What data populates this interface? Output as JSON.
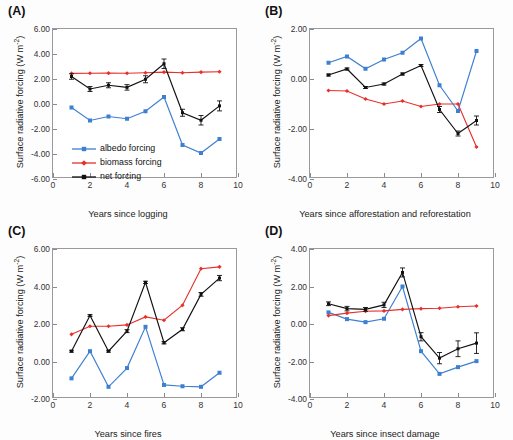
{
  "figure": {
    "ylabel": "Surface radiative forcing (W m",
    "ylabel_sup": "-2",
    "ylabel_end": ")",
    "colors": {
      "albedo": "#3d7fd0",
      "biomass": "#e8302a",
      "net": "#111111",
      "axis": "#9a9a9a",
      "background": "#ffffff"
    },
    "legend": {
      "albedo": "albedo forcing",
      "biomass": "biomass forcing",
      "net": "net forcing"
    }
  },
  "chart_data": [
    {
      "panel": "(A)",
      "type": "line",
      "title": "",
      "xlabel": "Years since logging",
      "ylabel": "Surface radiative forcing (W m-2)",
      "x": [
        1,
        2,
        3,
        4,
        5,
        6,
        7,
        8,
        9
      ],
      "xticks": [
        0,
        2,
        4,
        6,
        8,
        10
      ],
      "xticklabels": [
        "0",
        "2",
        "4",
        "6",
        "8",
        "10"
      ],
      "xlim": [
        0,
        10
      ],
      "yticks": [
        -6,
        -4,
        -2,
        0,
        2,
        4,
        6
      ],
      "yticklabels": [
        "-6.00",
        "-4.00",
        "-2.00",
        "0.00",
        "2.00",
        "4.00",
        "6.00"
      ],
      "ylim": [
        -6,
        6
      ],
      "grid": false,
      "legend_position": "lower-left",
      "series": [
        {
          "name": "albedo forcing",
          "color": "#3d7fd0",
          "marker": "square",
          "values": [
            -0.28,
            -1.32,
            -1.0,
            -1.18,
            -0.58,
            0.56,
            -3.28,
            -3.92,
            -2.8
          ],
          "errors": [
            0,
            0,
            0,
            0,
            0,
            0,
            0,
            0,
            0
          ]
        },
        {
          "name": "biomass forcing",
          "color": "#e8302a",
          "marker": "diamond",
          "values": [
            2.45,
            2.46,
            2.47,
            2.46,
            2.5,
            2.55,
            2.5,
            2.55,
            2.58
          ],
          "errors": [
            0,
            0,
            0,
            0,
            0,
            0,
            0,
            0,
            0
          ]
        },
        {
          "name": "net forcing",
          "color": "#111111",
          "marker": "square",
          "values": [
            2.2,
            1.2,
            1.5,
            1.33,
            1.98,
            3.22,
            -0.7,
            -1.3,
            -0.15
          ],
          "errors": [
            0.22,
            0.2,
            0.2,
            0.22,
            0.28,
            0.38,
            0.28,
            0.38,
            0.4
          ]
        }
      ]
    },
    {
      "panel": "(B)",
      "type": "line",
      "title": "",
      "xlabel": "Years since afforestation and reforestation",
      "ylabel": "Surface radiative forcing (W m-2)",
      "x": [
        1,
        2,
        3,
        4,
        5,
        6,
        7,
        8,
        9
      ],
      "xticks": [
        0,
        2,
        4,
        6,
        8,
        10
      ],
      "xticklabels": [
        "0",
        "2",
        "4",
        "6",
        "8",
        "10"
      ],
      "xlim": [
        0,
        10
      ],
      "yticks": [
        -4,
        -2,
        0,
        2
      ],
      "yticklabels": [
        "-4.00",
        "-2.00",
        "0.00",
        "2.00"
      ],
      "ylim": [
        -4,
        2
      ],
      "grid": false,
      "legend_position": "none",
      "series": [
        {
          "name": "albedo forcing",
          "color": "#3d7fd0",
          "marker": "square",
          "values": [
            0.65,
            0.9,
            0.41,
            0.78,
            1.05,
            1.62,
            -0.25,
            -1.28,
            1.12
          ],
          "errors": [
            0,
            0,
            0,
            0,
            0,
            0,
            0,
            0,
            0
          ]
        },
        {
          "name": "biomass forcing",
          "color": "#e8302a",
          "marker": "diamond",
          "values": [
            -0.46,
            -0.48,
            -0.8,
            -1.0,
            -0.88,
            -1.1,
            -1.0,
            -1.0,
            -2.72
          ],
          "errors": [
            0,
            0,
            0,
            0,
            0,
            0,
            0,
            0,
            0
          ]
        },
        {
          "name": "net forcing",
          "color": "#111111",
          "marker": "square",
          "values": [
            0.16,
            0.4,
            -0.34,
            -0.2,
            0.2,
            0.54,
            -1.22,
            -2.18,
            -1.66
          ],
          "errors": [
            0.04,
            0.04,
            0.04,
            0.04,
            0.04,
            0.04,
            0.12,
            0.1,
            0.18
          ]
        }
      ]
    },
    {
      "panel": "(C)",
      "type": "line",
      "title": "",
      "xlabel": "Years since fires",
      "ylabel": "Surface radiative forcing (W m-2)",
      "x": [
        1,
        2,
        3,
        4,
        5,
        6,
        7,
        8,
        9
      ],
      "xticks": [
        0,
        2,
        4,
        6,
        8,
        10
      ],
      "xticklabels": [
        "0",
        "2",
        "4",
        "6",
        "8",
        "10"
      ],
      "xlim": [
        0,
        10
      ],
      "yticks": [
        -2,
        0,
        2,
        4,
        6
      ],
      "yticklabels": [
        "-2.00",
        "0.00",
        "2.00",
        "4.00",
        "6.00"
      ],
      "ylim": [
        -2,
        6
      ],
      "grid": false,
      "legend_position": "none",
      "series": [
        {
          "name": "albedo forcing",
          "color": "#3d7fd0",
          "marker": "square",
          "values": [
            -0.9,
            0.55,
            -1.35,
            -0.35,
            1.85,
            -1.25,
            -1.32,
            -1.35,
            -0.6
          ],
          "errors": [
            0,
            0,
            0,
            0,
            0,
            0,
            0,
            0,
            0
          ]
        },
        {
          "name": "biomass forcing",
          "color": "#e8302a",
          "marker": "diamond",
          "values": [
            1.45,
            1.88,
            1.88,
            1.95,
            2.38,
            2.2,
            3.0,
            4.95,
            5.05
          ],
          "errors": [
            0,
            0,
            0,
            0,
            0,
            0,
            0,
            0,
            0
          ]
        },
        {
          "name": "net forcing",
          "color": "#111111",
          "marker": "square",
          "values": [
            0.55,
            2.45,
            0.55,
            1.62,
            4.22,
            1.0,
            1.72,
            3.58,
            4.45
          ],
          "errors": [
            0.05,
            0.05,
            0.05,
            0.08,
            0.06,
            0.06,
            0.08,
            0.1,
            0.14
          ]
        }
      ]
    },
    {
      "panel": "(D)",
      "type": "line",
      "title": "",
      "xlabel": "Years since insect damage",
      "ylabel": "Surface radiative forcing (W m-2)",
      "x": [
        1,
        2,
        3,
        4,
        5,
        6,
        7,
        8,
        9
      ],
      "xticks": [
        0,
        2,
        4,
        6,
        8,
        10
      ],
      "xticklabels": [
        "0",
        "2",
        "4",
        "6",
        "8",
        "10"
      ],
      "xlim": [
        0,
        10
      ],
      "yticks": [
        -4,
        -2,
        0,
        2,
        4
      ],
      "yticklabels": [
        "-4.00",
        "-2.00",
        "0.00",
        "2.00",
        "4.00"
      ],
      "ylim": [
        -4,
        4
      ],
      "grid": false,
      "legend_position": "none",
      "series": [
        {
          "name": "albedo forcing",
          "color": "#3d7fd0",
          "marker": "square",
          "values": [
            0.62,
            0.26,
            0.1,
            0.28,
            2.0,
            -1.45,
            -2.66,
            -2.3,
            -1.98
          ],
          "errors": [
            0,
            0,
            0,
            0,
            0,
            0,
            0,
            0,
            0
          ]
        },
        {
          "name": "biomass forcing",
          "color": "#e8302a",
          "marker": "diamond",
          "values": [
            0.45,
            0.58,
            0.68,
            0.7,
            0.78,
            0.82,
            0.84,
            0.92,
            0.96
          ],
          "errors": [
            0,
            0,
            0,
            0,
            0,
            0,
            0,
            0,
            0
          ]
        },
        {
          "name": "net forcing",
          "color": "#111111",
          "marker": "square",
          "values": [
            1.08,
            0.82,
            0.78,
            1.02,
            2.75,
            -0.68,
            -1.82,
            -1.32,
            -1.02
          ],
          "errors": [
            0.1,
            0.12,
            0.1,
            0.14,
            0.24,
            0.22,
            0.3,
            0.42,
            0.55
          ]
        }
      ]
    }
  ]
}
